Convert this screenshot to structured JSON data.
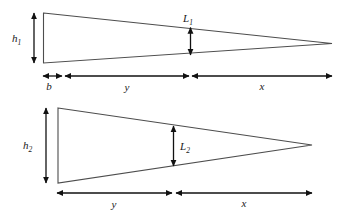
{
  "figure": {
    "background_color": "#ffffff",
    "outline_color": "#4d4d4d",
    "dimension_color": "#111111",
    "width": 342,
    "height": 215
  },
  "diagrams": [
    {
      "id": "upper-diagram",
      "name": "upper-tapered-shape",
      "labels": {
        "height": {
          "base": "h",
          "sub": "1"
        },
        "depth": {
          "base": "L",
          "sub": "1"
        },
        "base_segment": "b",
        "middle_segment": "y",
        "right_segment": "x"
      }
    },
    {
      "id": "lower-diagram",
      "name": "lower-tapered-shape",
      "labels": {
        "height": {
          "base": "h",
          "sub": "2"
        },
        "depth": {
          "base": "L",
          "sub": "2"
        },
        "middle_segment": "y",
        "right_segment": "x"
      }
    }
  ]
}
